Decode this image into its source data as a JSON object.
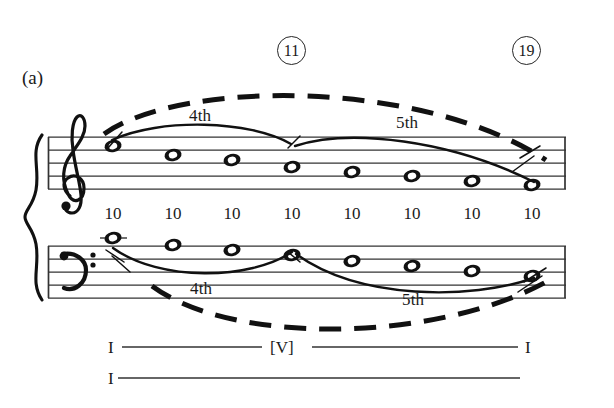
{
  "figure": {
    "panel_label": "(a)",
    "type": "schenkerian-voice-leading-graph"
  },
  "measure_markers": [
    {
      "name": "marker-11",
      "value": "11",
      "x": 291,
      "y": 35
    },
    {
      "name": "marker-19",
      "value": "19",
      "x": 526,
      "y": 35
    }
  ],
  "upper_staff": {
    "clef": "treble-clef",
    "clef_glyph": "𝄞",
    "slurs": [
      {
        "label": "4th",
        "label_x": 198,
        "label_y": 110
      },
      {
        "label": "5th",
        "label_x": 404,
        "label_y": 117
      }
    ],
    "notes": [
      {
        "index": 1,
        "x": 113,
        "y": 146
      },
      {
        "index": 2,
        "x": 173,
        "y": 155
      },
      {
        "index": 3,
        "x": 232,
        "y": 160
      },
      {
        "index": 4,
        "x": 292,
        "y": 167
      },
      {
        "index": 5,
        "x": 352,
        "y": 172
      },
      {
        "index": 6,
        "x": 412,
        "y": 176
      },
      {
        "index": 7,
        "x": 472,
        "y": 181
      },
      {
        "index": 8,
        "x": 532,
        "y": 185
      }
    ]
  },
  "intervals": {
    "values": [
      "10",
      "10",
      "10",
      "10",
      "10",
      "10",
      "10",
      "10"
    ],
    "x_positions": [
      113,
      173,
      232,
      292,
      352,
      412,
      472,
      532
    ],
    "y": 213
  },
  "lower_staff": {
    "clef": "bass-clef",
    "clef_glyph": "𝄢",
    "slurs": [
      {
        "label": "4th",
        "label_x": 199,
        "label_y": 287
      },
      {
        "label": "5th",
        "label_x": 411,
        "label_y": 298
      }
    ],
    "notes": [
      {
        "index": 1,
        "x": 113,
        "y": 238
      },
      {
        "index": 2,
        "x": 173,
        "y": 245
      },
      {
        "index": 3,
        "x": 232,
        "y": 250
      },
      {
        "index": 4,
        "x": 292,
        "y": 255
      },
      {
        "index": 5,
        "x": 352,
        "y": 261
      },
      {
        "index": 6,
        "x": 412,
        "y": 266
      },
      {
        "index": 7,
        "x": 472,
        "y": 271
      },
      {
        "index": 8,
        "x": 532,
        "y": 276
      }
    ]
  },
  "analysis": {
    "row_one": {
      "left": "I",
      "middle": "[V]",
      "right": "I"
    },
    "row_two": {
      "left": "I"
    }
  },
  "colors": {
    "ink": "#1a1a1a",
    "staff_line": "#333333",
    "background": "#ffffff"
  }
}
